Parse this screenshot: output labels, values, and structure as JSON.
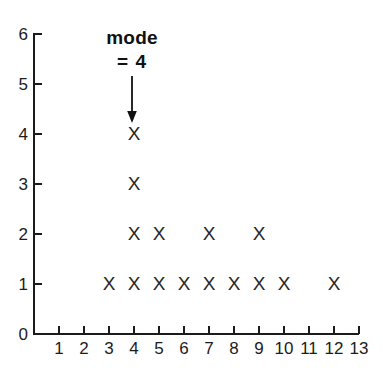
{
  "chart_data": {
    "type": "scatter",
    "plot_style": "dot-plot",
    "title": "",
    "xlabel": "",
    "ylabel": "",
    "xlim": [
      0,
      13
    ],
    "ylim": [
      0,
      6
    ],
    "grid": false,
    "legend": null,
    "marker_symbol": "X",
    "marker_color": "#262626",
    "axis_color": "#1b1b1b",
    "x_ticks": [
      1,
      2,
      3,
      4,
      5,
      6,
      7,
      8,
      9,
      10,
      11,
      12,
      13
    ],
    "y_ticks": [
      0,
      1,
      2,
      3,
      4,
      5,
      6
    ],
    "x_tick_labels": [
      "1",
      "2",
      "3",
      "4",
      "5",
      "6",
      "7",
      "8",
      "9",
      "10",
      "11",
      "12",
      "13"
    ],
    "y_tick_labels": [
      "0",
      "1",
      "2",
      "3",
      "4",
      "5",
      "6"
    ],
    "categories": [
      1,
      2,
      3,
      4,
      5,
      6,
      7,
      8,
      9,
      10,
      11,
      12,
      13
    ],
    "counts": [
      0,
      0,
      1,
      4,
      2,
      1,
      2,
      1,
      2,
      1,
      0,
      1,
      0
    ],
    "points": [
      {
        "x": 3,
        "y": 1
      },
      {
        "x": 4,
        "y": 1
      },
      {
        "x": 5,
        "y": 1
      },
      {
        "x": 6,
        "y": 1
      },
      {
        "x": 7,
        "y": 1
      },
      {
        "x": 8,
        "y": 1
      },
      {
        "x": 9,
        "y": 1
      },
      {
        "x": 10,
        "y": 1
      },
      {
        "x": 12,
        "y": 1
      },
      {
        "x": 4,
        "y": 2
      },
      {
        "x": 5,
        "y": 2
      },
      {
        "x": 7,
        "y": 2
      },
      {
        "x": 9,
        "y": 2
      },
      {
        "x": 4,
        "y": 3
      },
      {
        "x": 4,
        "y": 4
      }
    ],
    "annotations": [
      {
        "id": "mode",
        "line1": "mode",
        "line2": "= 4",
        "points_to_x": 4,
        "points_to_y": 4,
        "arrow": "down-arrow"
      }
    ]
  }
}
